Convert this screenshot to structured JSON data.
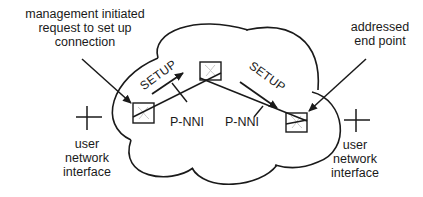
{
  "diagram": {
    "type": "network-diagram",
    "title": "",
    "labels": {
      "management": [
        "management initiated",
        "request to set up",
        "connection"
      ],
      "addressed": [
        "addressed",
        "end point"
      ],
      "uni_left": [
        "user",
        "network",
        "interface"
      ],
      "uni_right": [
        "user",
        "network",
        "interface"
      ]
    },
    "links": [
      {
        "label": "P-NNI",
        "message": "SETUP",
        "from": "left-switch",
        "to": "middle-switch"
      },
      {
        "label": "P-NNI",
        "message": "SETUP",
        "from": "middle-switch",
        "to": "right-switch"
      }
    ],
    "nodes": [
      "left-switch",
      "middle-switch",
      "right-switch"
    ],
    "icons": [
      "network-cloud",
      "switch-box",
      "interface-cross",
      "arrow"
    ],
    "colors": {
      "stroke": "#1a1a1a",
      "switch_glyph": "#bbbbbb",
      "background": "#ffffff"
    }
  }
}
